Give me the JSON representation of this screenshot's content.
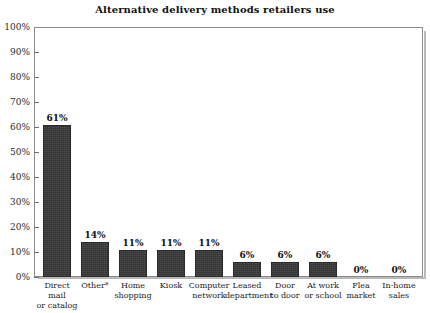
{
  "chart_data": {
    "type": "bar",
    "title": "Alternative delivery methods retailers use",
    "xlabel": "",
    "ylabel": "",
    "ylim": [
      0,
      100
    ],
    "grid": false,
    "legend": "none",
    "categories": [
      "Direct mail or catalog",
      "Other*",
      "Home shopping",
      "Kiosk",
      "Computer network",
      "Leased department",
      "Door to door",
      "At work or school",
      "Flea market",
      "In-home sales"
    ],
    "category_lines": [
      [
        "Direct mail",
        "or catalog"
      ],
      [
        "Other*",
        ""
      ],
      [
        "Home",
        "shopping"
      ],
      [
        "Kiosk",
        ""
      ],
      [
        "Computer",
        "network"
      ],
      [
        "Leased",
        "department"
      ],
      [
        "Door",
        "to door"
      ],
      [
        "At work",
        "or school"
      ],
      [
        "Flea",
        "market"
      ],
      [
        "In-home",
        "sales"
      ]
    ],
    "values": [
      61,
      14,
      11,
      11,
      11,
      6,
      6,
      6,
      0,
      0
    ],
    "value_labels": [
      "61%",
      "14%",
      "11%",
      "11%",
      "11%",
      "6%",
      "6%",
      "6%",
      "0%",
      "0%"
    ],
    "y_ticks": [
      0,
      10,
      20,
      30,
      40,
      50,
      60,
      70,
      80,
      90,
      100
    ],
    "y_tick_labels": [
      "0%",
      "10%",
      "20%",
      "30%",
      "40%",
      "50%",
      "60%",
      "70%",
      "80%",
      "90%",
      "100%"
    ],
    "bar_color": "#383838",
    "axis_color": "#8a8a8a",
    "background_color": "#ffffff",
    "text_color": "#111111"
  }
}
